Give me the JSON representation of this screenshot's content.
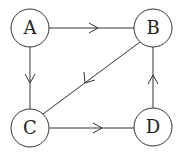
{
  "diagram": {
    "type": "directed-graph",
    "nodes": [
      {
        "id": "A",
        "label": "A",
        "cx": 30,
        "cy": 28
      },
      {
        "id": "B",
        "label": "B",
        "cx": 153,
        "cy": 28
      },
      {
        "id": "C",
        "label": "C",
        "cx": 30,
        "cy": 128
      },
      {
        "id": "D",
        "label": "D",
        "cx": 153,
        "cy": 127
      }
    ],
    "edges": [
      {
        "from": "A",
        "to": "B"
      },
      {
        "from": "A",
        "to": "C"
      },
      {
        "from": "B",
        "to": "C"
      },
      {
        "from": "C",
        "to": "D"
      },
      {
        "from": "D",
        "to": "B"
      }
    ],
    "colors": {
      "stroke": "#333333",
      "fill": "#ffffff",
      "text": "#222222"
    }
  }
}
